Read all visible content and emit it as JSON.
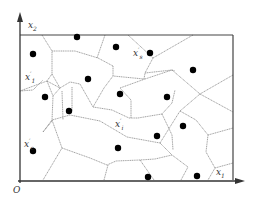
{
  "diagram": {
    "type": "voronoi-diagram",
    "axes": {
      "origin_label": "O",
      "x_axis_label": "x",
      "x_axis_sub": "1",
      "y_axis_label": "x",
      "y_axis_sub": "2"
    },
    "cell_labels": [
      {
        "id": "x1p",
        "base": "x",
        "sup": "′",
        "sub": "1",
        "x": 25,
        "y": 70
      },
      {
        "id": "xsp",
        "base": "x",
        "sup": "′",
        "sub": "s",
        "x": 133,
        "y": 47
      },
      {
        "id": "xip",
        "base": "x",
        "sup": "′",
        "sub": "i",
        "x": 115,
        "y": 118
      },
      {
        "id": "xcp",
        "base": "x",
        "sup": "′",
        "sub": "c",
        "x": 24,
        "y": 138
      }
    ],
    "sites": [
      [
        77,
        37
      ],
      [
        33,
        54
      ],
      [
        116,
        47
      ],
      [
        150,
        53
      ],
      [
        193,
        70
      ],
      [
        88,
        79
      ],
      [
        45,
        97
      ],
      [
        120,
        94
      ],
      [
        167,
        97
      ],
      [
        69,
        111
      ],
      [
        157,
        136
      ],
      [
        33,
        151
      ],
      [
        118,
        148
      ],
      [
        183,
        126
      ],
      [
        197,
        176
      ],
      [
        148,
        177
      ]
    ],
    "colors": {
      "axis": "#333333",
      "edge": "#8a8a8a",
      "site": "#000000"
    }
  }
}
